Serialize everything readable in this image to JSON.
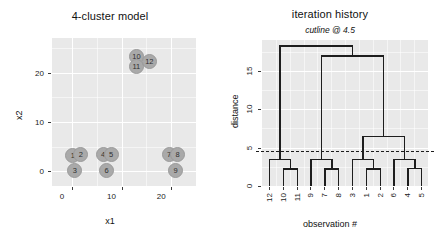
{
  "figure": {
    "width": 440,
    "height": 239,
    "background": "#ffffff",
    "panel_fill": "#e9e9e9",
    "grid_color": "#ffffff",
    "line_color": "#1d1d1d",
    "point_fill": "#a9a9a9"
  },
  "scatter": {
    "title": "4-cluster model",
    "xlabel": "x1",
    "ylabel": "x2",
    "x_ticks": [
      "0",
      "10",
      "20"
    ],
    "y_ticks": [
      "0",
      "10",
      "20"
    ]
  },
  "dendrogram": {
    "title": "iteration history",
    "subtitle": "cutline @ 4.5",
    "xlabel": "observation #",
    "ylabel": "distance",
    "y_ticks": [
      "0",
      "5",
      "10",
      "15"
    ],
    "leaf_labels": [
      "12",
      "10",
      "11",
      "9",
      "7",
      "8",
      "3",
      "1",
      "2",
      "6",
      "4",
      "5"
    ],
    "cutline_value": 4.5
  },
  "chart_data": [
    {
      "type": "scatter",
      "title": "4-cluster model",
      "xlabel": "x1",
      "ylabel": "x2",
      "xlim": [
        -4,
        25
      ],
      "ylim": [
        -3,
        27
      ],
      "xticks": [
        0,
        10,
        20
      ],
      "yticks": [
        0,
        10,
        20
      ],
      "grid": true,
      "point_labels": true,
      "points": [
        {
          "label": "1",
          "x": 0.2,
          "y": 3.2
        },
        {
          "label": "2",
          "x": 1.8,
          "y": 3.4
        },
        {
          "label": "3",
          "x": 0.6,
          "y": 0.2
        },
        {
          "label": "4",
          "x": 6.3,
          "y": 3.3
        },
        {
          "label": "5",
          "x": 7.9,
          "y": 3.4
        },
        {
          "label": "6",
          "x": 7.0,
          "y": 0.2
        },
        {
          "label": "7",
          "x": 19.6,
          "y": 3.3
        },
        {
          "label": "8",
          "x": 21.3,
          "y": 3.4
        },
        {
          "label": "9",
          "x": 20.9,
          "y": 0.2
        },
        {
          "label": "10",
          "x": 13.0,
          "y": 23.3
        },
        {
          "label": "11",
          "x": 13.0,
          "y": 21.2
        },
        {
          "label": "12",
          "x": 15.6,
          "y": 22.3
        }
      ]
    },
    {
      "type": "dendrogram",
      "title": "iteration history",
      "subtitle": "cutline @ 4.5",
      "xlabel": "observation #",
      "ylabel": "distance",
      "ylim": [
        0,
        19
      ],
      "yticks": [
        0,
        5,
        10,
        15
      ],
      "grid": true,
      "leaf_order": [
        "12",
        "10",
        "11",
        "9",
        "7",
        "8",
        "3",
        "1",
        "2",
        "6",
        "4",
        "5"
      ],
      "cutline": {
        "value": 4.5,
        "style": "dashed"
      },
      "merges": [
        {
          "id": "m1",
          "children": [
            "10",
            "11"
          ],
          "height": 2.3
        },
        {
          "id": "m2",
          "children": [
            "12",
            "m1"
          ],
          "height": 3.5
        },
        {
          "id": "m3",
          "children": [
            "7",
            "8"
          ],
          "height": 2.3
        },
        {
          "id": "m4",
          "children": [
            "9",
            "m3"
          ],
          "height": 3.5
        },
        {
          "id": "m5",
          "children": [
            "1",
            "2"
          ],
          "height": 2.3
        },
        {
          "id": "m6",
          "children": [
            "3",
            "m5"
          ],
          "height": 3.5
        },
        {
          "id": "m7",
          "children": [
            "4",
            "5"
          ],
          "height": 2.4
        },
        {
          "id": "m8",
          "children": [
            "6",
            "m7"
          ],
          "height": 3.5
        },
        {
          "id": "m9",
          "children": [
            "m6",
            "m8"
          ],
          "height": 6.5
        },
        {
          "id": "m10",
          "children": [
            "m4",
            "m9"
          ],
          "height": 17.0
        },
        {
          "id": "m11",
          "children": [
            "m2",
            "m10"
          ],
          "height": 18.3
        }
      ]
    }
  ]
}
